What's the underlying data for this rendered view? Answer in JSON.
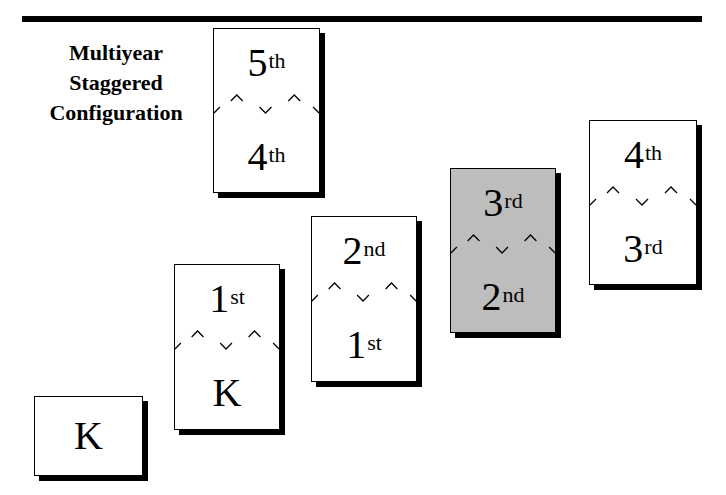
{
  "title": {
    "lines": [
      "Multiyear",
      "Staggered",
      "Configuration"
    ]
  },
  "boxes": [
    {
      "id": "k",
      "top": {
        "base": "K",
        "sup": ""
      },
      "bottom": null,
      "fill": "#ffffff"
    },
    {
      "id": "1st-k",
      "top": {
        "base": "1",
        "sup": "st"
      },
      "bottom": {
        "base": "K",
        "sup": ""
      },
      "fill": "#ffffff"
    },
    {
      "id": "2nd-1st",
      "top": {
        "base": "2",
        "sup": "nd"
      },
      "bottom": {
        "base": "1",
        "sup": "st"
      },
      "fill": "#ffffff"
    },
    {
      "id": "3rd-2nd",
      "top": {
        "base": "3",
        "sup": "rd"
      },
      "bottom": {
        "base": "2",
        "sup": "nd"
      },
      "fill": "#bdbdbd"
    },
    {
      "id": "4th-3rd",
      "top": {
        "base": "4",
        "sup": "th"
      },
      "bottom": {
        "base": "3",
        "sup": "rd"
      },
      "fill": "#ffffff"
    },
    {
      "id": "5th-4th",
      "top": {
        "base": "5",
        "sup": "th"
      },
      "bottom": {
        "base": "4",
        "sup": "th"
      },
      "fill": "#ffffff"
    }
  ],
  "colors": {
    "highlight": "#bdbdbd",
    "ink": "#000000"
  }
}
